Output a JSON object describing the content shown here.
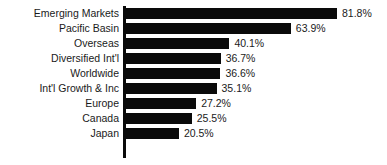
{
  "chart_data": {
    "type": "bar",
    "orientation": "horizontal",
    "title": "",
    "subtitle": "",
    "xlabel": "",
    "ylabel": "",
    "grid": false,
    "legend": false,
    "axis_color": "#0a0a0a",
    "bar_color": "#0a0a0a",
    "text_color": "#1a1a1a",
    "background": "#ffffff",
    "xlim": [
      0,
      81.8
    ],
    "value_suffix": "%",
    "categories": [
      "Emerging Markets",
      "Pacific Basin",
      "Overseas",
      "Diversified Int'l",
      "Worldwide",
      "Int'l Growth & Inc",
      "Europe",
      "Canada",
      "Japan"
    ],
    "values": [
      81.8,
      63.9,
      40.1,
      36.7,
      36.6,
      35.1,
      27.2,
      25.5,
      20.5
    ],
    "value_labels": [
      "81.8%",
      "63.9%",
      "40.1%",
      "36.7%",
      "36.6%",
      "35.1%",
      "27.2%",
      "25.5%",
      "20.5%"
    ]
  }
}
